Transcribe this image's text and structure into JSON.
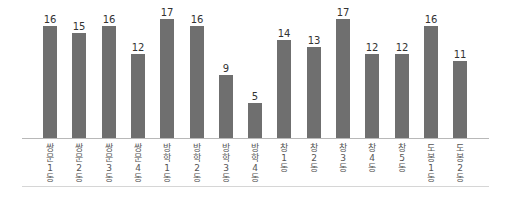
{
  "chart_data": {
    "type": "bar",
    "title": "",
    "xlabel": "",
    "ylabel": "",
    "categories": [
      "쌍문1동",
      "쌍문2동",
      "쌍문3동",
      "쌍문4동",
      "방학1동",
      "방학2동",
      "방학3동",
      "방학4동",
      "창1동",
      "창2동",
      "창3동",
      "창4동",
      "창5동",
      "도봉1동",
      "도봉2동"
    ],
    "category_lines": [
      [
        "쌍",
        "문",
        "1",
        "동"
      ],
      [
        "쌍",
        "문",
        "2",
        "동"
      ],
      [
        "쌍",
        "문",
        "3",
        "동"
      ],
      [
        "쌍",
        "문",
        "4",
        "동"
      ],
      [
        "방",
        "학",
        "1",
        "동"
      ],
      [
        "방",
        "학",
        "2",
        "동"
      ],
      [
        "방",
        "학",
        "3",
        "동"
      ],
      [
        "방",
        "학",
        "4",
        "동"
      ],
      [
        "창",
        "1",
        "동"
      ],
      [
        "창",
        "2",
        "동"
      ],
      [
        "창",
        "3",
        "동"
      ],
      [
        "창",
        "4",
        "동"
      ],
      [
        "창",
        "5",
        "동"
      ],
      [
        "도",
        "봉",
        "1",
        "동"
      ],
      [
        "도",
        "봉",
        "2",
        "동"
      ]
    ],
    "values": [
      16,
      15,
      16,
      12,
      17,
      16,
      9,
      5,
      14,
      13,
      17,
      12,
      12,
      16,
      11
    ],
    "ylim": [
      0,
      18
    ],
    "grid": false,
    "data_labels": true,
    "bar_color": "#6f6f6f"
  }
}
